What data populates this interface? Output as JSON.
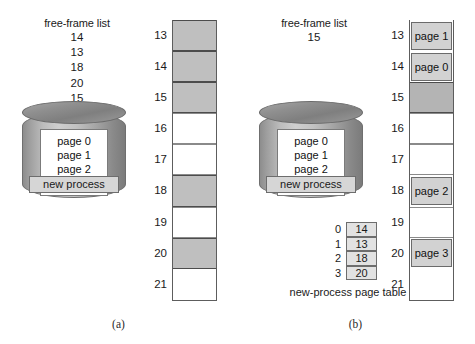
{
  "figure": {
    "caption_a": "(a)",
    "caption_b": "(b)"
  },
  "panel_a": {
    "free_frame_list": {
      "title": "free-frame list",
      "frames": [
        "14",
        "13",
        "18",
        "20",
        "15"
      ]
    },
    "process_disk": {
      "pages": [
        "page 0",
        "page 1",
        "page 2",
        "page 3"
      ],
      "label": "new process"
    },
    "memory": {
      "frames": [
        {
          "number": "13",
          "state": "filled",
          "content": ""
        },
        {
          "number": "14",
          "state": "filled",
          "content": ""
        },
        {
          "number": "15",
          "state": "filled",
          "content": ""
        },
        {
          "number": "16",
          "state": "empty",
          "content": ""
        },
        {
          "number": "17",
          "state": "empty",
          "content": ""
        },
        {
          "number": "18",
          "state": "filled",
          "content": ""
        },
        {
          "number": "19",
          "state": "empty",
          "content": ""
        },
        {
          "number": "20",
          "state": "filled",
          "content": ""
        },
        {
          "number": "21",
          "state": "blank",
          "content": ""
        }
      ]
    }
  },
  "panel_b": {
    "free_frame_list": {
      "title": "free-frame list",
      "frames": [
        "15"
      ]
    },
    "process_disk": {
      "pages": [
        "page 0",
        "page 1",
        "page 2",
        "page 3"
      ],
      "label": "new process"
    },
    "page_table": {
      "caption": "new-process page table",
      "rows": [
        {
          "index": "0",
          "frame": "14"
        },
        {
          "index": "1",
          "frame": "13"
        },
        {
          "index": "2",
          "frame": "18"
        },
        {
          "index": "3",
          "frame": "20"
        }
      ]
    },
    "memory": {
      "frames": [
        {
          "number": "13",
          "state": "paged",
          "content": "page 1"
        },
        {
          "number": "14",
          "state": "paged",
          "content": "page 0"
        },
        {
          "number": "15",
          "state": "freegray",
          "content": ""
        },
        {
          "number": "16",
          "state": "empty",
          "content": ""
        },
        {
          "number": "17",
          "state": "empty",
          "content": ""
        },
        {
          "number": "18",
          "state": "paged",
          "content": "page 2"
        },
        {
          "number": "19",
          "state": "empty",
          "content": ""
        },
        {
          "number": "20",
          "state": "paged",
          "content": "page 3"
        },
        {
          "number": "21",
          "state": "blank",
          "content": ""
        }
      ]
    }
  },
  "colors": {
    "filled_frame": "#bfbfbf",
    "free_frame_b": "#b4b4b4",
    "page_box": "#d2d2d2",
    "disk_label": "#d6d6d6",
    "outline": "#5d5d5d"
  }
}
